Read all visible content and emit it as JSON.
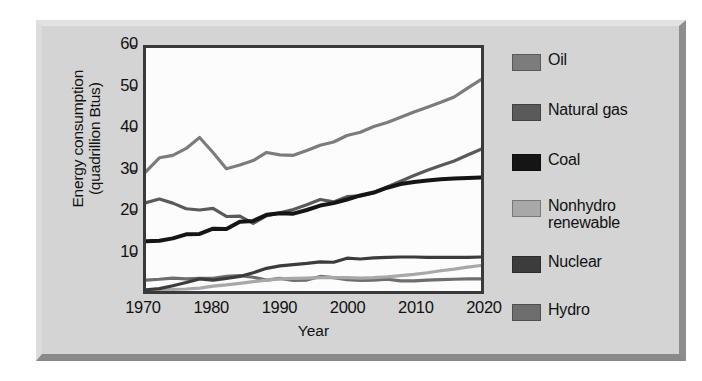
{
  "figure": {
    "frame_color": "#d4d4d4",
    "plot_background": "#fcfcfc",
    "axis_color": "#3a3a3a"
  },
  "axes": {
    "y_title_line1": "Energy consumption",
    "y_title_line2": "(quadrillion Btus)",
    "x_title": "Year",
    "y_ticks": [
      "10",
      "20",
      "30",
      "40",
      "50",
      "60"
    ],
    "x_ticks": [
      "1970",
      "1980",
      "1990",
      "2000",
      "2010",
      "2020"
    ]
  },
  "legend": {
    "items": [
      {
        "label": "Oil",
        "color": "#7c7c7c"
      },
      {
        "label": "Natural gas",
        "color": "#5a5a5a"
      },
      {
        "label": "Coal",
        "color": "#151515"
      },
      {
        "label": "Nonhydro\nrenewable",
        "color": "#a8a8a8"
      },
      {
        "label": "Nuclear",
        "color": "#3c3c3c"
      },
      {
        "label": "Hydro",
        "color": "#6e6e6e"
      }
    ]
  },
  "chart_data": {
    "type": "line",
    "title": "",
    "xlabel": "Year",
    "ylabel": "Energy consumption (quadrillion Btus)",
    "xlim": [
      1970,
      2020
    ],
    "ylim": [
      0,
      60
    ],
    "yticks": [
      10,
      20,
      30,
      40,
      50,
      60
    ],
    "xticks": [
      1970,
      1980,
      1990,
      2000,
      2010,
      2020
    ],
    "grid": false,
    "legend_position": "right",
    "x": [
      1970,
      1972,
      1974,
      1976,
      1978,
      1980,
      1982,
      1984,
      1986,
      1988,
      1990,
      1992,
      1994,
      1996,
      1998,
      2000,
      2002,
      2004,
      2006,
      2008,
      2010,
      2012,
      2014,
      2016,
      2018,
      2020
    ],
    "series": [
      {
        "name": "Oil",
        "color": "#7c7c7c",
        "values": [
          29.5,
          32.9,
          33.5,
          35.2,
          37.9,
          34.2,
          30.2,
          31.1,
          32.2,
          34.2,
          33.6,
          33.5,
          34.7,
          36.0,
          36.8,
          38.4,
          39.2,
          40.6,
          41.6,
          42.9,
          44.2,
          45.4,
          46.6,
          47.9,
          50.1,
          52.2
        ]
      },
      {
        "name": "Natural gas",
        "color": "#5a5a5a",
        "values": [
          21.8,
          22.7,
          21.7,
          20.3,
          20.0,
          20.4,
          18.4,
          18.5,
          16.7,
          18.6,
          19.3,
          20.1,
          21.3,
          22.6,
          22.0,
          23.3,
          23.5,
          24.3,
          25.7,
          27.1,
          28.5,
          29.8,
          31.0,
          32.1,
          33.6,
          35.0
        ]
      },
      {
        "name": "Coal",
        "color": "#151515",
        "values": [
          12.3,
          12.4,
          13.0,
          14.0,
          14.1,
          15.4,
          15.3,
          17.1,
          17.3,
          18.8,
          19.2,
          19.1,
          20.0,
          21.1,
          21.7,
          22.6,
          23.6,
          24.3,
          25.5,
          26.4,
          26.9,
          27.3,
          27.6,
          27.8,
          27.9,
          28.0
        ]
      },
      {
        "name": "Nonhydro renewable",
        "color": "#a8a8a8",
        "values": [
          0.2,
          0.3,
          0.4,
          0.5,
          0.7,
          1.2,
          1.5,
          1.9,
          2.3,
          2.7,
          3.0,
          3.1,
          3.2,
          3.3,
          3.3,
          3.3,
          3.2,
          3.3,
          3.5,
          3.8,
          4.1,
          4.5,
          5.0,
          5.4,
          5.9,
          6.3
        ]
      },
      {
        "name": "Nuclear",
        "color": "#3c3c3c",
        "values": [
          0.3,
          0.6,
          1.3,
          2.1,
          3.0,
          2.7,
          3.1,
          3.6,
          4.5,
          5.6,
          6.2,
          6.5,
          6.8,
          7.2,
          7.1,
          8.1,
          7.9,
          8.2,
          8.3,
          8.4,
          8.4,
          8.3,
          8.3,
          8.3,
          8.3,
          8.4
        ]
      },
      {
        "name": "Hydro",
        "color": "#6e6e6e",
        "values": [
          2.7,
          2.9,
          3.2,
          3.0,
          3.1,
          3.1,
          3.6,
          3.8,
          3.4,
          2.7,
          3.1,
          2.6,
          2.7,
          3.6,
          3.3,
          2.8,
          2.6,
          2.7,
          2.9,
          2.5,
          2.5,
          2.7,
          2.8,
          2.9,
          3.0,
          3.0
        ]
      }
    ]
  }
}
